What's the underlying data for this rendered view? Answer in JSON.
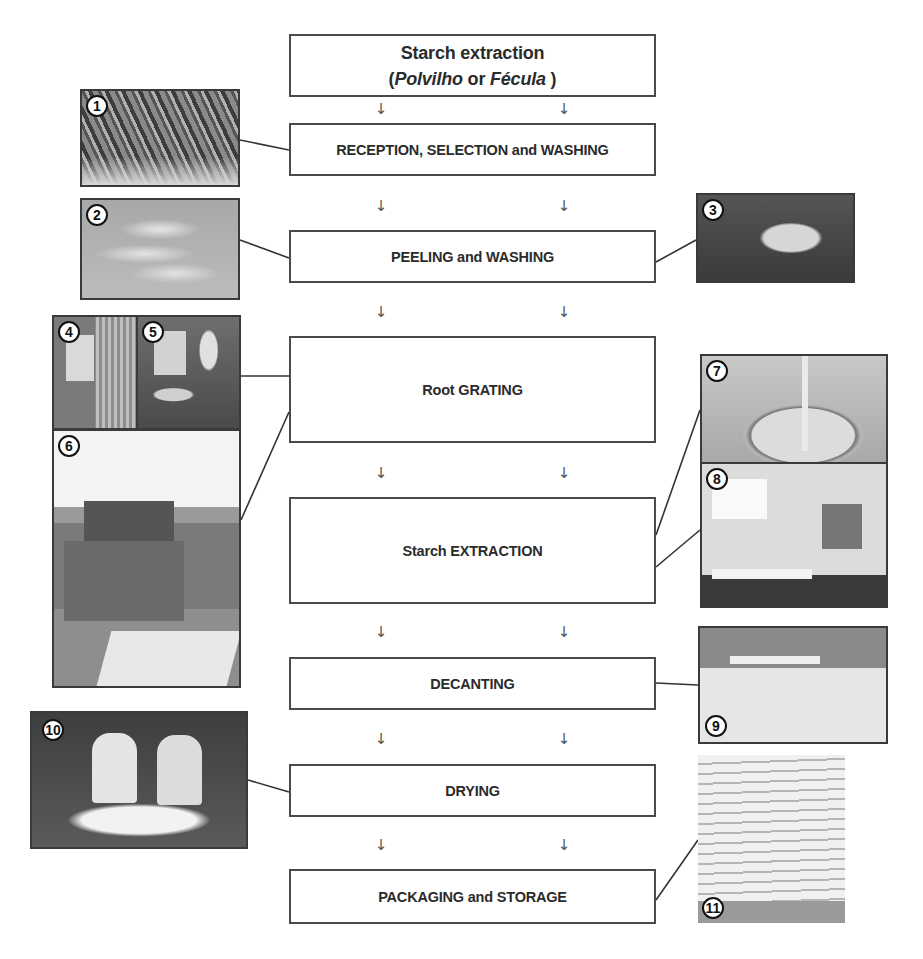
{
  "diagram": {
    "title_line1": "Starch extraction",
    "title_open": "(",
    "title_term1": "Polvilho",
    "title_or": " or ",
    "title_term2": "Fécula",
    "title_close": " )",
    "arrow_glyph": "↓",
    "steps": [
      {
        "label": "RECEPTION, SELECTION and WASHING",
        "photos": [
          "1"
        ]
      },
      {
        "label": "PEELING and WASHING",
        "photos": [
          "2",
          "3"
        ]
      },
      {
        "label": "Root GRATING",
        "photos": [
          "4",
          "5",
          "6"
        ]
      },
      {
        "label": "Starch EXTRACTION",
        "photos": [
          "7",
          "8"
        ]
      },
      {
        "label": "DECANTING",
        "photos": [
          "9"
        ]
      },
      {
        "label": "DRYING",
        "photos": [
          "10"
        ]
      },
      {
        "label": "PACKAGING and STORAGE",
        "photos": [
          "11"
        ]
      }
    ],
    "photos": [
      {
        "num": "1",
        "subject": "cassava roots"
      },
      {
        "num": "2",
        "subject": "peeled roots in crate"
      },
      {
        "num": "3",
        "subject": "peeled roots in basin"
      },
      {
        "num": "4",
        "subject": "grater drum"
      },
      {
        "num": "5",
        "subject": "roots fed into grater"
      },
      {
        "num": "6",
        "subject": "grating machine"
      },
      {
        "num": "7",
        "subject": "extraction tank"
      },
      {
        "num": "8",
        "subject": "extraction equipment"
      },
      {
        "num": "9",
        "subject": "decanting tank"
      },
      {
        "num": "10",
        "subject": "workers drying starch"
      },
      {
        "num": "11",
        "subject": "stacked starch bags"
      }
    ]
  }
}
